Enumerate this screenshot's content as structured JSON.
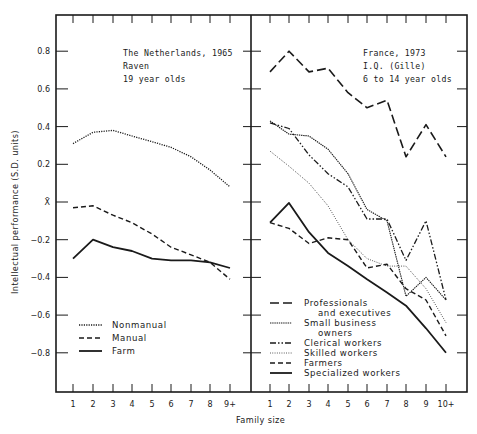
{
  "chart_data": [
    {
      "type": "line",
      "panel": "left",
      "title": "The Netherlands, 1965",
      "subtitle_lines": [
        "The Netherlands, 1965",
        "Raven",
        "19 year olds"
      ],
      "xlabel": "Family size",
      "ylabel": "Intellectual performance (S.D. units)",
      "categories": [
        "1",
        "2",
        "3",
        "4",
        "5",
        "6",
        "7",
        "8",
        "9+"
      ],
      "ylim": [
        -1.0,
        1.0
      ],
      "yticks": [
        0.8,
        0.6,
        0.4,
        0.2,
        0,
        -0.2,
        -0.4,
        -0.6,
        -0.8
      ],
      "ytick_labels": [
        "0.8",
        "0.6",
        "0.4",
        "0.2",
        "X̄",
        "−0.2",
        "−0.4",
        "−0.6",
        "−0.8"
      ],
      "grid": false,
      "legend_position": "lower left",
      "series": [
        {
          "name": "Nonmanual",
          "style": "dotted",
          "values": [
            0.31,
            0.37,
            0.38,
            0.35,
            0.32,
            0.29,
            0.24,
            0.17,
            0.08
          ]
        },
        {
          "name": "Manual",
          "style": "dashed",
          "values": [
            -0.03,
            -0.02,
            -0.07,
            -0.11,
            -0.17,
            -0.24,
            -0.28,
            -0.32,
            -0.41
          ]
        },
        {
          "name": "Farm",
          "style": "solid",
          "values": [
            -0.3,
            -0.2,
            -0.24,
            -0.26,
            -0.3,
            -0.31,
            -0.31,
            -0.32,
            -0.35
          ]
        }
      ]
    },
    {
      "type": "line",
      "panel": "right",
      "title": "France, 1973",
      "subtitle_lines": [
        "France, 1973",
        "I.Q. (Gille)",
        "6 to 14 year olds"
      ],
      "xlabel": "Family size",
      "ylabel": "Intellectual performance (S.D. units)",
      "categories": [
        "1",
        "2",
        "3",
        "4",
        "5",
        "6",
        "7",
        "8",
        "9",
        "10+"
      ],
      "ylim": [
        -1.0,
        1.0
      ],
      "grid": false,
      "legend_position": "lower left",
      "series": [
        {
          "name": "Professionals and executives",
          "style": "longdash",
          "values": [
            0.69,
            0.8,
            0.69,
            0.71,
            0.58,
            0.5,
            0.54,
            0.24,
            0.41,
            0.24
          ]
        },
        {
          "name": "Small business owners",
          "style": "densedot",
          "values": [
            0.43,
            0.36,
            0.35,
            0.28,
            0.15,
            -0.04,
            -0.1,
            -0.5,
            -0.4,
            -0.52
          ]
        },
        {
          "name": "Clerical workers",
          "style": "dashdotdot",
          "values": [
            0.42,
            0.39,
            0.25,
            0.15,
            0.08,
            -0.09,
            -0.09,
            -0.31,
            -0.1,
            -0.52
          ]
        },
        {
          "name": "Skilled workers",
          "style": "finedot",
          "values": [
            0.27,
            0.19,
            0.1,
            -0.02,
            -0.2,
            -0.3,
            -0.34,
            -0.34,
            -0.46,
            -0.64
          ]
        },
        {
          "name": "Farmers",
          "style": "dashed",
          "values": [
            -0.11,
            -0.14,
            -0.22,
            -0.19,
            -0.2,
            -0.35,
            -0.33,
            -0.46,
            -0.52,
            -0.71
          ]
        },
        {
          "name": "Specialized workers",
          "style": "solid",
          "values": [
            -0.11,
            -0.005,
            -0.16,
            -0.27,
            -0.34,
            -0.41,
            -0.48,
            -0.55,
            -0.67,
            -0.8
          ]
        }
      ]
    }
  ],
  "figure": {
    "ylabel": "Intellectual performance (S.D. units)",
    "xlabel": "Family size",
    "left_legend": [
      {
        "label": "Nonmanual",
        "style": "dotted"
      },
      {
        "label": "Manual",
        "style": "dashed"
      },
      {
        "label": "Farm",
        "style": "solid"
      }
    ],
    "right_legend": [
      {
        "label_lines": [
          "Professionals",
          "and executives"
        ],
        "style": "longdash"
      },
      {
        "label_lines": [
          "Small business",
          "owners"
        ],
        "style": "densedot"
      },
      {
        "label_lines": [
          "Clerical workers"
        ],
        "style": "dashdotdot"
      },
      {
        "label_lines": [
          "Skilled workers"
        ],
        "style": "finedot"
      },
      {
        "label_lines": [
          "Farmers"
        ],
        "style": "dashed"
      },
      {
        "label_lines": [
          "Specialized workers"
        ],
        "style": "solid"
      }
    ],
    "colors": {
      "ink": "#1a1a1a",
      "background": "#ffffff"
    }
  }
}
